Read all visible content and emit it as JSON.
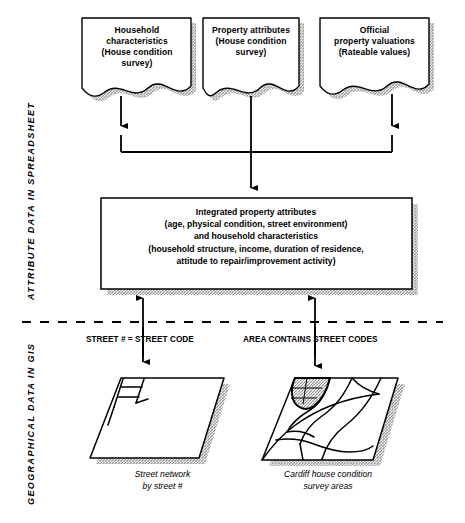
{
  "diagram": {
    "side_labels": {
      "top": "ATTRIBUTE DATA IN SPREADSHEET",
      "bottom": "GEOGRAPHICAL DATA IN GIS"
    },
    "sources": [
      {
        "name": "household-characteristics",
        "lines": [
          "Household",
          "characteristics",
          "(House condition",
          "survey)"
        ]
      },
      {
        "name": "property-attributes",
        "lines": [
          "Property attributes",
          "(House condition",
          "survey)"
        ]
      },
      {
        "name": "official-property-valuations",
        "lines": [
          "Official",
          "property valuations",
          "(Rateable values)"
        ]
      }
    ],
    "integrated": {
      "lines": [
        "Integrated property attributes",
        "(age, physical condition, street environment)",
        "and household characteristics",
        "(household structure, income,  duration of residence,",
        "attitude to repair/improvement activity)"
      ]
    },
    "relations": [
      {
        "name": "street-relation",
        "text": "STREET # = STREET CODE"
      },
      {
        "name": "area-relation",
        "text": "AREA CONTAINS STREET CODES"
      }
    ],
    "maps": [
      {
        "name": "street-network-map",
        "caption": [
          "Street network",
          "by street #"
        ]
      },
      {
        "name": "survey-areas-map",
        "caption": [
          "Cardiff house condition",
          "survey areas"
        ]
      }
    ],
    "colors": {
      "stroke": "#000000",
      "fill": "#ffffff",
      "shadow": "#9a9a9a",
      "hatch": "#b8b8b8"
    }
  }
}
